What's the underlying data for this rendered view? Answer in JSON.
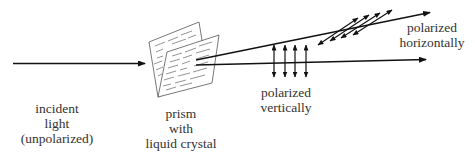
{
  "labels": {
    "incident": [
      "incident",
      "light",
      "(unpolarized)"
    ],
    "prism": [
      "prism",
      "with",
      "liquid crystal"
    ],
    "vertical": [
      "polarized",
      "vertically"
    ],
    "horizontal": [
      "polarized",
      "horizontally"
    ]
  },
  "elements": {
    "incident_ray": "arrow",
    "prism": "liquid-crystal-prism",
    "ray_horizontal": "arrow",
    "ray_vertical": "arrow",
    "vertical_polarization_arrows": 4,
    "horizontal_polarization_arrows": 4
  },
  "colors": {
    "stroke": "#111111",
    "text": "#333333",
    "prism_stroke": "#555555"
  }
}
